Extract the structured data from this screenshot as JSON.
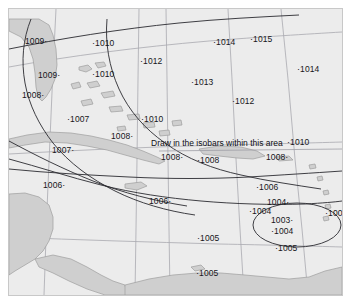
{
  "map": {
    "title": "Surface pressure analysis - Caribbean / Gulf of Mexico",
    "instruction": "Draw in the isobars within this area",
    "colors": {
      "ocean": "#ececec",
      "land": "#cfcfcf",
      "land_stroke": "#9a9a9a",
      "graticule": "#9e9ea6",
      "isobar": "#2a2a30",
      "text": "#16161a",
      "frame": "#c8c8c8",
      "page_background": "#ffffff"
    },
    "units": "hPa",
    "station_observations": [
      {
        "id": "obs-1009-a",
        "value": "1009",
        "dot": "after",
        "x": 24,
        "y": 36
      },
      {
        "id": "obs-1010-a",
        "value": "1010",
        "dot": "before",
        "x": 91,
        "y": 38
      },
      {
        "id": "obs-1012-a",
        "value": "1012",
        "dot": "before",
        "x": 139,
        "y": 56
      },
      {
        "id": "obs-1014-a",
        "value": "1014",
        "dot": "before",
        "x": 212,
        "y": 37
      },
      {
        "id": "obs-1015-a",
        "value": "1015",
        "dot": "before",
        "x": 249,
        "y": 34
      },
      {
        "id": "obs-1009-b",
        "value": "1009",
        "dot": "after",
        "x": 37,
        "y": 70
      },
      {
        "id": "obs-1010-b",
        "value": "1010",
        "dot": "before",
        "x": 91,
        "y": 69
      },
      {
        "id": "obs-1013-a",
        "value": "1013",
        "dot": "before",
        "x": 190,
        "y": 77
      },
      {
        "id": "obs-1014-b",
        "value": "1014",
        "dot": "before",
        "x": 296,
        "y": 64
      },
      {
        "id": "obs-1008-a",
        "value": "1008",
        "dot": "after",
        "x": 21,
        "y": 90
      },
      {
        "id": "obs-1012-b",
        "value": "1012",
        "dot": "before",
        "x": 231,
        "y": 96
      },
      {
        "id": "obs-1007-a",
        "value": "1007",
        "dot": "before",
        "x": 66,
        "y": 114
      },
      {
        "id": "obs-1010-c",
        "value": "1010",
        "dot": "before",
        "x": 140,
        "y": 114
      },
      {
        "id": "obs-1008-b",
        "value": "1008",
        "dot": "after",
        "x": 110,
        "y": 131
      },
      {
        "id": "obs-1010-d",
        "value": "1010",
        "dot": "before",
        "x": 286,
        "y": 137
      },
      {
        "id": "obs-1007-b",
        "value": "1007",
        "dot": "after",
        "x": 51,
        "y": 145
      },
      {
        "id": "obs-1008-c",
        "value": "1008",
        "dot": "after",
        "x": 160,
        "y": 152
      },
      {
        "id": "obs-1008-d",
        "value": "1008",
        "dot": "before",
        "x": 196,
        "y": 155
      },
      {
        "id": "obs-1008-e",
        "value": "1008",
        "dot": "after",
        "x": 265,
        "y": 152
      },
      {
        "id": "obs-1006-a",
        "value": "1006",
        "dot": "after",
        "x": 42,
        "y": 180
      },
      {
        "id": "obs-1006-b",
        "value": "1006",
        "dot": "after",
        "x": 148,
        "y": 196
      },
      {
        "id": "obs-1006-c",
        "value": "1006",
        "dot": "before",
        "x": 255,
        "y": 182
      },
      {
        "id": "obs-1004-a",
        "value": "1004",
        "dot": "after",
        "x": 266,
        "y": 197
      },
      {
        "id": "obs-1004-b",
        "value": "1004",
        "dot": "before",
        "x": 248,
        "y": 206
      },
      {
        "id": "obs-1004-c",
        "value": "1004",
        "dot": "before",
        "x": 324,
        "y": 208
      },
      {
        "id": "obs-1003-a",
        "value": "1003",
        "dot": "after",
        "x": 270,
        "y": 215
      },
      {
        "id": "obs-1004-d",
        "value": "1004",
        "dot": "before",
        "x": 270,
        "y": 226
      },
      {
        "id": "obs-1005-a",
        "value": "1005",
        "dot": "before",
        "x": 196,
        "y": 233
      },
      {
        "id": "obs-1005-b",
        "value": "1005",
        "dot": "before",
        "x": 274,
        "y": 243
      },
      {
        "id": "obs-1005-c",
        "value": "1005",
        "dot": "before",
        "x": 195,
        "y": 268
      }
    ]
  },
  "chart_data": {
    "type": "map",
    "units": "hPa",
    "low_center": {
      "label": "1003",
      "x": 288,
      "y": 216
    },
    "pressure_range": [
      1003,
      1015
    ],
    "isobar_contours": [
      1004,
      1006,
      1008,
      1010
    ],
    "landmasses": [
      "Florida",
      "Bahamas",
      "Cuba",
      "Hispaniola",
      "Puerto Rico",
      "Jamaica",
      "Yucatan",
      "Central America",
      "South America"
    ],
    "values": [
      1009,
      1010,
      1012,
      1014,
      1015,
      1009,
      1010,
      1013,
      1014,
      1008,
      1012,
      1007,
      1010,
      1008,
      1010,
      1007,
      1008,
      1008,
      1008,
      1006,
      1006,
      1006,
      1004,
      1004,
      1004,
      1003,
      1004,
      1005,
      1005,
      1005
    ]
  }
}
